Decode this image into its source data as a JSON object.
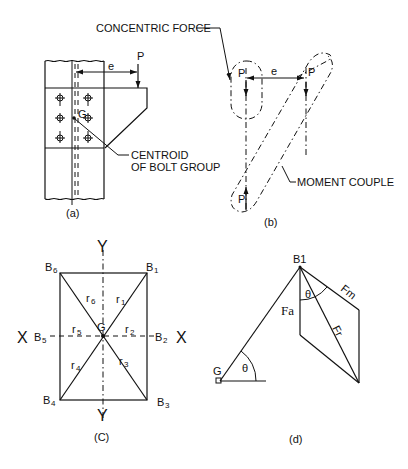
{
  "panels": {
    "a": {
      "caption": "(a)",
      "load_label": "P",
      "eccentricity_label": "e",
      "centroid_label": "G",
      "callout_line1": "CENTROID",
      "callout_line2": "OF BOLT GROUP"
    },
    "b": {
      "caption": "(b)",
      "concentric_force_label": "CONCENTRIC FORCE",
      "moment_couple_label": "MOMENT COUPLE",
      "force_labels": [
        "P",
        "P",
        "P"
      ],
      "eccentricity_label": "e"
    },
    "c": {
      "caption": "(C)",
      "centroid_label": "G",
      "axis_x_left": "X",
      "axis_x_right": "X",
      "axis_y_top": "Y",
      "axis_y_bottom": "Y",
      "bolts": [
        {
          "name": "B",
          "sub": "1"
        },
        {
          "name": "B",
          "sub": "2"
        },
        {
          "name": "B",
          "sub": "3"
        },
        {
          "name": "B",
          "sub": "4"
        },
        {
          "name": "B",
          "sub": "5"
        },
        {
          "name": "B",
          "sub": "6"
        }
      ],
      "radii": [
        {
          "name": "r",
          "sub": "1"
        },
        {
          "name": "r",
          "sub": "2"
        },
        {
          "name": "r",
          "sub": "3"
        },
        {
          "name": "r",
          "sub": "4"
        },
        {
          "name": "r",
          "sub": "5"
        },
        {
          "name": "r",
          "sub": "6"
        }
      ]
    },
    "d": {
      "caption": "(d)",
      "bolt_label": "B1",
      "centroid_label": "G",
      "angle_label": "θ",
      "force_direct": "Fa",
      "force_moment": "Fm",
      "force_resultant": "Fr"
    }
  }
}
